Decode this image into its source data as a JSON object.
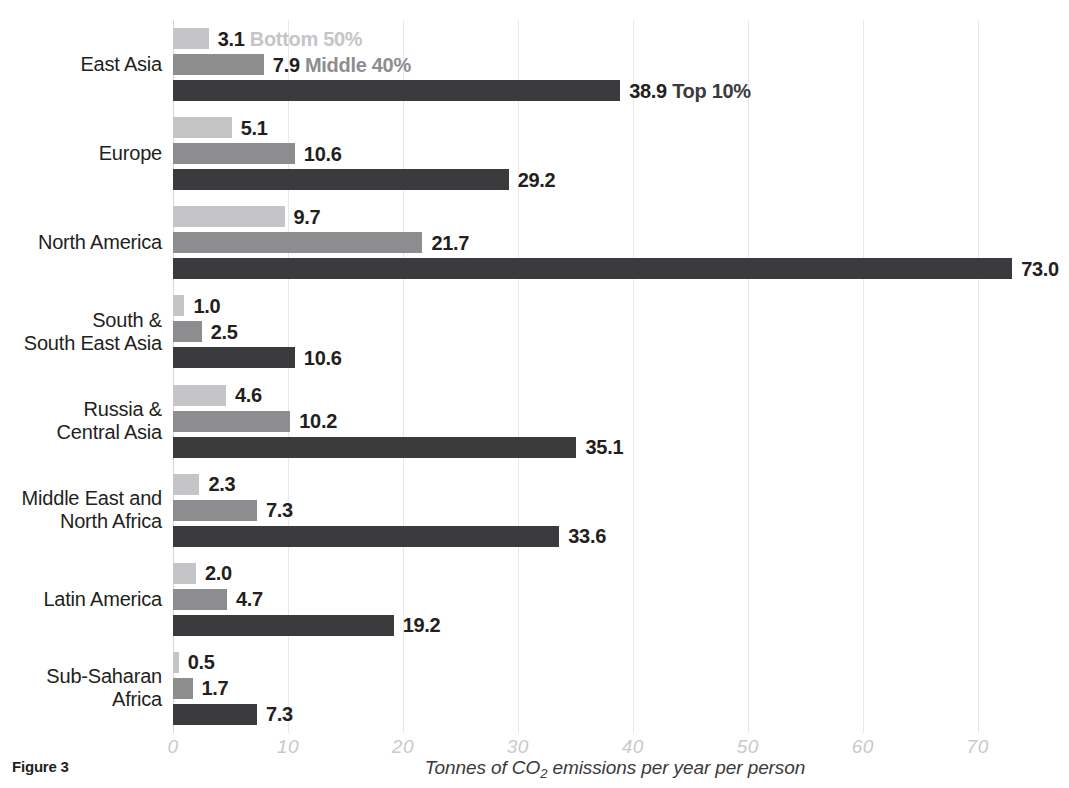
{
  "figure": {
    "caption": "Figure 3",
    "xlabel_prefix": "Tonnes of CO",
    "xlabel_sub": "2",
    "xlabel_suffix": " emissions per year per person"
  },
  "chart_data": {
    "type": "bar",
    "orientation": "horizontal",
    "title": "",
    "xlabel": "Tonnes of CO2 emissions per year per person",
    "ylabel": "",
    "xlim": [
      0,
      76.9
    ],
    "xticks": [
      0,
      10,
      20,
      30,
      40,
      50,
      60,
      70
    ],
    "xtick_labels": [
      "0",
      "10",
      "20",
      "30",
      "40",
      "50",
      "60",
      "70"
    ],
    "grid": true,
    "grid_axis": "x",
    "legend_position": "inline-first-group",
    "categories": [
      "East Asia",
      "Europe",
      "North America",
      "South &\nSouth East Asia",
      "Russia &\nCentral Asia",
      "Middle East and\nNorth Africa",
      "Latin America",
      "Sub-Saharan\nAfrica"
    ],
    "series": [
      {
        "name": "Bottom 50%",
        "color": "#c5c5c7",
        "values": [
          3.1,
          5.1,
          9.7,
          1.0,
          4.6,
          2.3,
          2.0,
          0.5
        ],
        "labels": [
          "3.1",
          "5.1",
          "9.7",
          "1.0",
          "4.6",
          "2.3",
          "2.0",
          "0.5"
        ]
      },
      {
        "name": "Middle 40%",
        "color": "#8d8d90",
        "values": [
          7.9,
          10.6,
          21.7,
          2.5,
          10.2,
          7.3,
          4.7,
          1.7
        ],
        "labels": [
          "7.9",
          "10.6",
          "21.7",
          "2.5",
          "10.2",
          "7.3",
          "4.7",
          "1.7"
        ]
      },
      {
        "name": "Top 10%",
        "color": "#3b3a3c",
        "values": [
          38.9,
          29.2,
          73.0,
          10.6,
          35.1,
          33.6,
          19.2,
          7.3
        ],
        "labels": [
          "38.9",
          "29.2",
          "73.0",
          "10.6",
          "35.1",
          "33.6",
          "19.2",
          "7.3"
        ]
      }
    ]
  }
}
